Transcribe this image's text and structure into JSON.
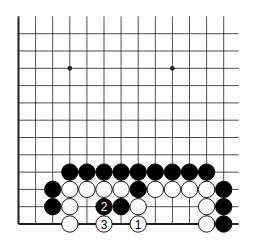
{
  "diagram": {
    "type": "go-board-fragment",
    "board_corner": "bottom-left",
    "columns_visible": 13,
    "rows_visible": 13,
    "colors": {
      "background": "#ffffff",
      "line": "#222222",
      "black_stone": "#000000",
      "white_stone": "#ffffff",
      "stone_outline": "#000000"
    },
    "star_points": [
      {
        "col": 3,
        "row": 9
      },
      {
        "col": 9,
        "row": 9
      }
    ],
    "stones": [
      {
        "color": "black",
        "col": 3,
        "row": 3
      },
      {
        "color": "black",
        "col": 4,
        "row": 3
      },
      {
        "color": "black",
        "col": 5,
        "row": 3
      },
      {
        "color": "black",
        "col": 6,
        "row": 3
      },
      {
        "color": "black",
        "col": 7,
        "row": 3
      },
      {
        "color": "black",
        "col": 8,
        "row": 3
      },
      {
        "color": "black",
        "col": 9,
        "row": 3
      },
      {
        "color": "black",
        "col": 10,
        "row": 3
      },
      {
        "color": "black",
        "col": 11,
        "row": 3
      },
      {
        "color": "black",
        "col": 2,
        "row": 2
      },
      {
        "color": "white",
        "col": 3,
        "row": 2
      },
      {
        "color": "white",
        "col": 4,
        "row": 2
      },
      {
        "color": "white",
        "col": 5,
        "row": 2
      },
      {
        "color": "white",
        "col": 6,
        "row": 2
      },
      {
        "color": "black",
        "col": 7,
        "row": 2
      },
      {
        "color": "white",
        "col": 8,
        "row": 2
      },
      {
        "color": "white",
        "col": 9,
        "row": 2
      },
      {
        "color": "white",
        "col": 10,
        "row": 2
      },
      {
        "color": "white",
        "col": 11,
        "row": 2
      },
      {
        "color": "black",
        "col": 12,
        "row": 2
      },
      {
        "color": "black",
        "col": 2,
        "row": 1
      },
      {
        "color": "white",
        "col": 3,
        "row": 1
      },
      {
        "color": "black",
        "col": 5,
        "row": 1,
        "label": "2"
      },
      {
        "color": "black",
        "col": 6,
        "row": 1
      },
      {
        "color": "white",
        "col": 7,
        "row": 1
      },
      {
        "color": "white",
        "col": 11,
        "row": 1
      },
      {
        "color": "black",
        "col": 12,
        "row": 1
      },
      {
        "color": "white",
        "col": 3,
        "row": 0
      },
      {
        "color": "white",
        "col": 5,
        "row": 0,
        "label": "3"
      },
      {
        "color": "white",
        "col": 7,
        "row": 0,
        "label": "1"
      },
      {
        "color": "white",
        "col": 11,
        "row": 0
      },
      {
        "color": "black",
        "col": 12,
        "row": 0
      }
    ],
    "move_labels": [
      "1",
      "2",
      "3"
    ]
  }
}
